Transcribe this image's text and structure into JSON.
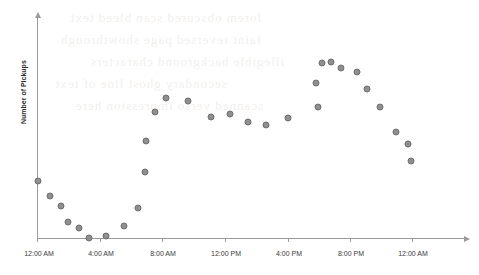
{
  "figure": {
    "background_color": "#ffffff",
    "marker_color": "#8f8f8f",
    "marker_edge_color": "#6e6e6e",
    "axis_color": "#9a9a9a",
    "ghost_lines": [
      "lorem obscured scan bleed text",
      "faint reversed page showthrough",
      "illegible background characters",
      "secondary ghost line of text",
      "scanned verso impression here"
    ]
  },
  "chart_data": {
    "type": "scatter",
    "title": "",
    "xlabel": "",
    "ylabel": "Number of Pickups",
    "grid": false,
    "legend": false,
    "xtick_labels": [
      "12:00 AM",
      "4:00 AM",
      "8:00 AM",
      "12:00 PM",
      "4:00 PM",
      "8:00 PM",
      "12:00 AM"
    ],
    "xtick_hours": [
      0,
      4,
      8,
      12,
      16,
      20,
      24
    ],
    "ytick_labels": [],
    "xlim": [
      -0.5,
      25.5
    ],
    "ylim": [
      0,
      100
    ],
    "x": [
      0,
      1,
      2,
      3,
      4,
      5,
      6,
      7,
      8,
      9,
      10,
      11,
      12,
      13,
      14,
      15,
      16,
      17,
      18,
      19,
      20,
      21,
      22,
      23,
      24
    ],
    "x_time_labels": [
      "12:00 AM",
      "1:00 AM",
      "2:00 AM",
      "3:00 AM",
      "4:00 AM",
      "5:00 AM",
      "6:00 AM",
      "7:00 AM",
      "8:00 AM",
      "9:00 AM",
      "10:00 AM",
      "11:00 AM",
      "12:00 PM",
      "1:00 PM",
      "2:00 PM",
      "3:00 PM",
      "4:00 PM",
      "5:00 PM",
      "6:00 PM",
      "7:00 PM",
      "8:00 PM",
      "9:00 PM",
      "10:00 PM",
      "11:00 PM",
      "12:00 AM"
    ],
    "values": [
      33,
      27,
      23,
      17,
      11,
      10,
      15,
      23,
      38,
      58,
      70,
      77,
      72,
      62,
      65,
      58,
      55,
      62,
      58,
      66,
      80,
      88,
      89,
      86,
      83
    ],
    "series": [
      {
        "name": "Pickups by hour",
        "values": [
          33,
          27,
          23,
          17,
          11,
          10,
          15,
          23,
          38,
          58,
          70,
          77,
          72,
          62,
          65,
          58,
          55,
          62,
          58,
          66,
          80,
          88,
          89,
          86,
          83
        ]
      }
    ],
    "points": [
      {
        "x": 0.0,
        "y": 33,
        "px": 38,
        "py": 181
      },
      {
        "x": 0.85,
        "y": 27,
        "px": 50,
        "py": 196
      },
      {
        "x": 1.7,
        "y": 23,
        "px": 61,
        "py": 206
      },
      {
        "x": 2.55,
        "y": 17,
        "px": 68,
        "py": 222
      },
      {
        "x": 3.4,
        "y": 11,
        "px": 79,
        "py": 228
      },
      {
        "x": 4.2,
        "y": 8,
        "px": 89,
        "py": 238
      },
      {
        "x": 5.0,
        "y": 10,
        "px": 106,
        "py": 236
      },
      {
        "x": 5.9,
        "y": 15,
        "px": 124,
        "py": 226
      },
      {
        "x": 6.8,
        "y": 23,
        "px": 138,
        "py": 208
      },
      {
        "x": 7.6,
        "y": 41,
        "px": 145,
        "py": 172
      },
      {
        "x": 8.3,
        "y": 58,
        "px": 146,
        "py": 141
      },
      {
        "x": 9.0,
        "y": 70,
        "px": 155,
        "py": 112
      },
      {
        "x": 10.1,
        "y": 78,
        "px": 166,
        "py": 98
      },
      {
        "x": 11.2,
        "y": 72,
        "px": 188,
        "py": 101
      },
      {
        "x": 12.3,
        "y": 64,
        "px": 211,
        "py": 117
      },
      {
        "x": 13.4,
        "y": 66,
        "px": 230,
        "py": 114
      },
      {
        "x": 14.5,
        "y": 60,
        "px": 248,
        "py": 122
      },
      {
        "x": 15.6,
        "y": 57,
        "px": 266,
        "py": 125
      },
      {
        "x": 16.7,
        "y": 62,
        "px": 288,
        "py": 118
      },
      {
        "x": 17.6,
        "y": 68,
        "px": 318,
        "py": 107
      },
      {
        "x": 18.4,
        "y": 78,
        "px": 316,
        "py": 83
      },
      {
        "x": 19.2,
        "y": 88,
        "px": 322,
        "py": 63
      },
      {
        "x": 20.0,
        "y": 90,
        "px": 331,
        "py": 62
      },
      {
        "x": 20.8,
        "y": 88,
        "px": 341,
        "py": 68
      },
      {
        "x": 21.5,
        "y": 84,
        "px": 357,
        "py": 72
      },
      {
        "x": 22.2,
        "y": 76,
        "px": 367,
        "py": 89
      },
      {
        "x": 22.9,
        "y": 66,
        "px": 380,
        "py": 107
      },
      {
        "x": 23.4,
        "y": 50,
        "px": 396,
        "py": 132
      },
      {
        "x": 23.8,
        "y": 42,
        "px": 408,
        "py": 144
      },
      {
        "x": 24.2,
        "y": 34,
        "px": 411,
        "py": 161
      }
    ]
  }
}
